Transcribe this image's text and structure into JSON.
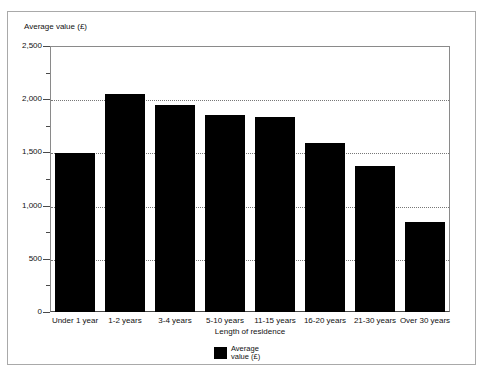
{
  "chart_data": {
    "type": "bar",
    "title": "",
    "categories": [
      "Under 1 year",
      "1-2 years",
      "3-4 years",
      "5-10 years",
      "11-15 years",
      "16-20 years",
      "21-30 years",
      "Over 30 years"
    ],
    "values": [
      1490,
      2050,
      1950,
      1850,
      1830,
      1590,
      1370,
      845
    ],
    "series": [
      {
        "name": "Average value (£)",
        "values": [
          1490,
          2050,
          1950,
          1850,
          1830,
          1590,
          1370,
          845
        ],
        "color": "#000000"
      }
    ],
    "xlabel": "Length of residence",
    "ylabel": "Average value (£)",
    "ylim": [
      0,
      2500
    ],
    "ytick_labels": [
      "0",
      "500",
      "1,000",
      "1,500",
      "2,000",
      "2,500"
    ],
    "ytick_values": [
      0,
      500,
      1000,
      1500,
      2000,
      2500
    ],
    "yminor_values": [
      250,
      750,
      1250,
      1750,
      2250
    ],
    "gridlines": [
      2000,
      1500,
      1000,
      500
    ],
    "grid": true,
    "grid_style": "dotted",
    "legend_position": "bottom-center"
  },
  "legend": {
    "entries": [
      {
        "label": "Average\nvalue (£)",
        "color": "#000000"
      }
    ]
  },
  "axes": {
    "y_title": "Average value (£)",
    "x_title": "Length of residence"
  }
}
